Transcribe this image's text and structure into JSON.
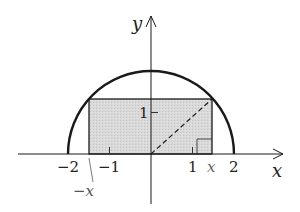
{
  "diagram": {
    "colors": {
      "stroke": "#1a1a1a",
      "fill_rect": "#d6d6d6",
      "label": "#222222",
      "label_x": "#555555"
    },
    "axes": {
      "x_label": "x",
      "y_label": "y",
      "x_ticks": [
        {
          "value": -2,
          "label": "−2"
        },
        {
          "value": -1,
          "label": "−1"
        },
        {
          "value": 1,
          "label": "1"
        },
        {
          "value": 2,
          "label": "2"
        }
      ],
      "y_ticks": [
        {
          "value": 1,
          "label": "1"
        }
      ]
    },
    "semicircle": {
      "radius": 2
    },
    "rectangle": {
      "x_left_label": "−x",
      "x_right_label": "x"
    }
  }
}
